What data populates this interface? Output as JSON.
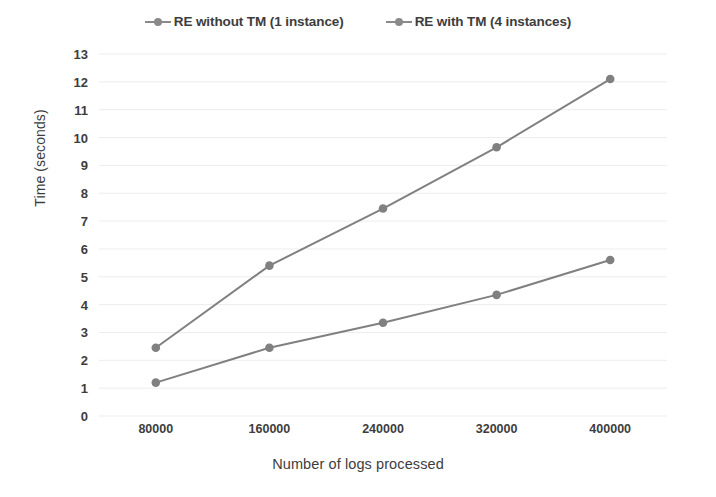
{
  "chart_data": {
    "type": "line",
    "title": "",
    "xlabel": "Number of logs processed",
    "ylabel": "Time (seconds)",
    "categories": [
      "80000",
      "160000",
      "240000",
      "320000",
      "400000"
    ],
    "series": [
      {
        "name": "RE without TM (1 instance)",
        "values": [
          2.45,
          5.4,
          7.45,
          9.65,
          12.1
        ],
        "color": "#808080"
      },
      {
        "name": "RE with TM (4 instances)",
        "values": [
          1.2,
          2.45,
          3.35,
          4.35,
          5.6
        ],
        "color": "#808080"
      }
    ],
    "ylim": [
      0,
      13
    ],
    "ytick_step": 1,
    "yticks": [
      "13",
      "12",
      "11",
      "10",
      "9",
      "8",
      "7",
      "6",
      "5",
      "4",
      "3",
      "2",
      "1",
      "0"
    ],
    "grid": true,
    "grid_color": "#ededed",
    "legend_position": "top",
    "background": "#ffffff"
  },
  "legend": {
    "entries": [
      {
        "label": "RE without TM (1 instance)",
        "marker": "line-with-dot-marker"
      },
      {
        "label": "RE with TM (4 instances)",
        "marker": "line-with-dot-marker"
      }
    ]
  }
}
